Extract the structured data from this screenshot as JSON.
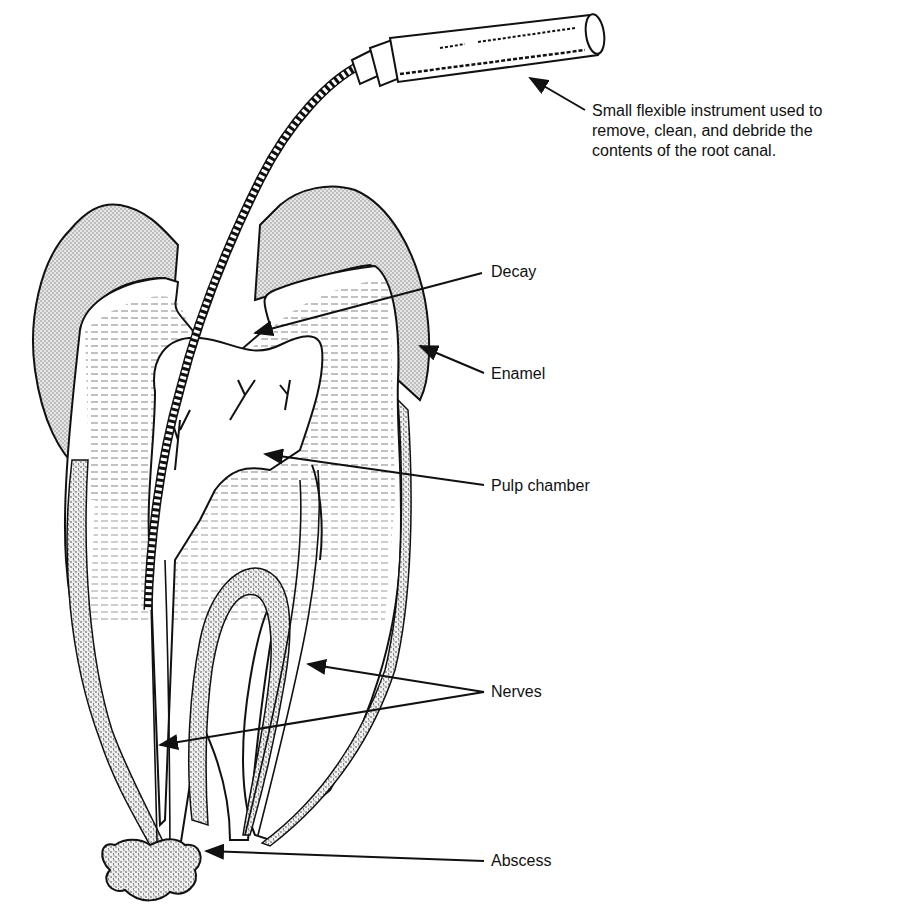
{
  "diagram": {
    "type": "labeled-illustration",
    "labels": [
      {
        "id": "instrument",
        "text": "Small flexible instrument used to remove, clean, and debride the contents of the root canal.",
        "lines": [
          "Small flexible instrument used to",
          "remove, clean, and debride the",
          "contents of the root canal."
        ]
      },
      {
        "id": "decay",
        "text": "Decay"
      },
      {
        "id": "enamel",
        "text": "Enamel"
      },
      {
        "id": "pulp_chamber",
        "text": "Pulp chamber"
      },
      {
        "id": "nerves",
        "text": "Nerves"
      },
      {
        "id": "abscess",
        "text": "Abscess"
      }
    ],
    "colors": {
      "ink": "#111111",
      "enamel_fill": "#d9d9d9",
      "cementum_fill": "#cfcfcf",
      "background": "#ffffff"
    }
  }
}
